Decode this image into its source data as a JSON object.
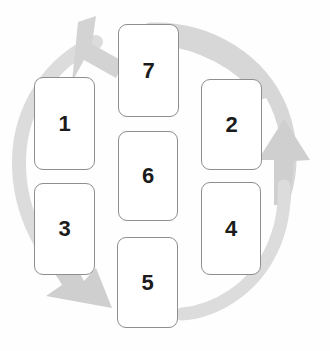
{
  "diagram": {
    "background_color": "#fefefe",
    "card_fill_color": "#ffffff",
    "card_border_color": "#8e8e8e",
    "label_color": "#1b1b1b",
    "arrow_color": "#d5d5d5",
    "arrow_color_dark": "#c9c9c9",
    "cards": [
      {
        "label": "1",
        "name": "card-1",
        "x": 34,
        "y": 77,
        "w": 61,
        "h": 93
      },
      {
        "label": "2",
        "name": "card-2",
        "x": 201,
        "y": 79,
        "w": 61,
        "h": 91
      },
      {
        "label": "3",
        "name": "card-3",
        "x": 34,
        "y": 183,
        "w": 61,
        "h": 92
      },
      {
        "label": "4",
        "name": "card-4",
        "x": 201,
        "y": 182,
        "w": 60,
        "h": 93
      },
      {
        "label": "5",
        "name": "card-5",
        "x": 117,
        "y": 237,
        "w": 61,
        "h": 91
      },
      {
        "label": "6",
        "name": "card-6",
        "x": 118,
        "y": 131,
        "w": 60,
        "h": 90
      },
      {
        "label": "7",
        "name": "card-7",
        "x": 118,
        "y": 24,
        "w": 61,
        "h": 93
      }
    ],
    "arrows": [
      {
        "name": "clockwise-arc-arrow-right",
        "direction": "up",
        "description": "Gray arc sweeping from top-center clockwise around the right side, ending in an upward-pointing arrowhead at the right"
      },
      {
        "name": "counterclockwise-arc-arrow-left",
        "direction": "down-right",
        "description": "Gray arc sweeping from the right side around the left, ending in a down-right pointing arrowhead at the bottom-left"
      },
      {
        "name": "arc-arrow-top-left-head",
        "direction": "down-right",
        "description": "Gray arrowhead at the top-left pointing down and to the right toward card 7"
      }
    ]
  }
}
